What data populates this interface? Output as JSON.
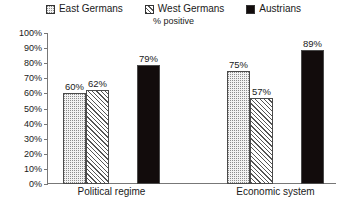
{
  "chart_data": {
    "type": "bar",
    "title": "",
    "subtitle": "% positive",
    "xlabel": "",
    "ylabel": "",
    "ylim": [
      0,
      100
    ],
    "grid": false,
    "legend_position": "top",
    "categories": [
      "Political regime",
      "Economic system"
    ],
    "series": [
      {
        "name": "East Germans",
        "pattern": "dotted",
        "values": [
          60,
          57
        ],
        "labels": [
          "60%",
          "57%"
        ]
      },
      {
        "name": "West Germans",
        "pattern": "diagonal-hatch",
        "values": [
          62,
          57
        ],
        "labels": [
          "62%",
          "57%"
        ]
      },
      {
        "name": "Austrians",
        "pattern": "solid-black",
        "values": [
          79,
          89
        ],
        "labels": [
          "79%",
          "89%"
        ]
      }
    ],
    "bars": [
      {
        "category": "Political regime",
        "series": "East Germans",
        "value": 60,
        "label": "60%"
      },
      {
        "category": "Political regime",
        "series": "West Germans",
        "value": 62,
        "label": "62%"
      },
      {
        "category": "Political regime",
        "series": "Austrians",
        "value": 79,
        "label": "79%"
      },
      {
        "category": "Economic system",
        "series": "East Germans",
        "value": 75,
        "label": "75%"
      },
      {
        "category": "Economic system",
        "series": "West Germans",
        "value": 57,
        "label": "57%"
      },
      {
        "category": "Economic system",
        "series": "Austrians",
        "value": 89,
        "label": "89%"
      }
    ],
    "yticks": [
      0,
      10,
      20,
      30,
      40,
      50,
      60,
      70,
      80,
      90,
      100
    ],
    "ytick_labels": [
      "0%",
      "10%",
      "20%",
      "30%",
      "40%",
      "50%",
      "60%",
      "70%",
      "80%",
      "90%",
      "100%"
    ]
  },
  "legend": {
    "items": [
      {
        "label": "East Germans",
        "pattern": "dotted"
      },
      {
        "label": "West Germans",
        "pattern": "diagonal-hatch"
      },
      {
        "label": "Austrians",
        "pattern": "solid-black"
      }
    ]
  },
  "colors": {
    "axis": "#777777",
    "bar_outline": "#4a4a4a",
    "solid_bar": "#120c0c",
    "dotted_bar_bg": "#f2f2f2",
    "text": "#1a1a1a",
    "background": "#ffffff"
  }
}
